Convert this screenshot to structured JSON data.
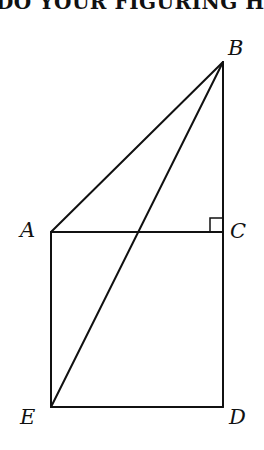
{
  "header": {
    "text": "DO YOUR FIGURING HERE"
  },
  "diagram": {
    "points": {
      "A": {
        "label": "A",
        "x": 51,
        "y": 232
      },
      "B": {
        "label": "B",
        "x": 223,
        "y": 62
      },
      "C": {
        "label": "C",
        "x": 223,
        "y": 232
      },
      "D": {
        "label": "D",
        "x": 223,
        "y": 407
      },
      "E": {
        "label": "E",
        "x": 51,
        "y": 407
      }
    },
    "segments": [
      "AB",
      "BE",
      "AC",
      "BC",
      "CD",
      "AE",
      "ED"
    ],
    "right_angle_at": "C",
    "stroke_color": "#111111"
  }
}
